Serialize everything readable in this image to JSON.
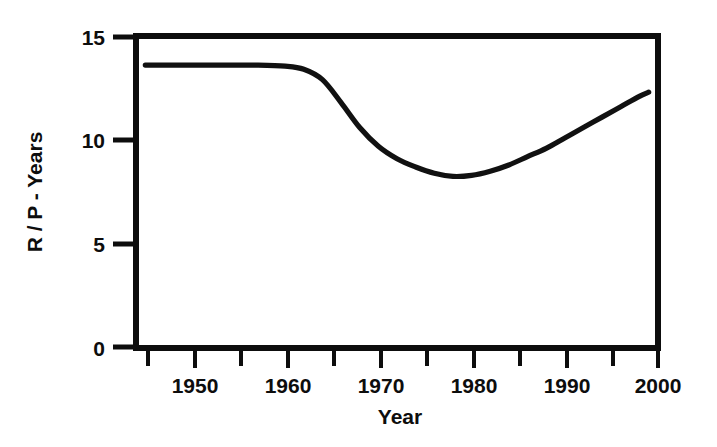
{
  "chart_data": {
    "type": "line",
    "title": "",
    "subtitle": "",
    "xlabel": "Year",
    "ylabel": "R / P - Years",
    "xlim": [
      1944,
      2000
    ],
    "ylim": [
      0,
      15
    ],
    "grid": false,
    "legend": null,
    "x_ticks": [
      1950,
      1960,
      1970,
      1980,
      1990,
      2000
    ],
    "x_tick_labels": [
      "1950",
      "1960",
      "1970",
      "1980",
      "1990",
      "2000"
    ],
    "x_minor_tick_interval": 5,
    "y_ticks": [
      0,
      5,
      10,
      15
    ],
    "y_tick_labels": [
      "0",
      "5",
      "10",
      "15"
    ],
    "line_color": "#111111",
    "line_width_px": 5,
    "series": [
      {
        "name": "R/P ratio",
        "x": [
          1945,
          1948,
          1951,
          1954,
          1957,
          1960,
          1962,
          1964,
          1966,
          1968,
          1970,
          1972,
          1974,
          1976,
          1978,
          1980,
          1982,
          1984,
          1986,
          1988,
          1990,
          1992,
          1994,
          1996,
          1998,
          1999
        ],
        "values": [
          13.6,
          13.6,
          13.6,
          13.6,
          13.6,
          13.55,
          13.4,
          12.9,
          11.8,
          10.6,
          9.7,
          9.1,
          8.7,
          8.4,
          8.25,
          8.3,
          8.5,
          8.8,
          9.2,
          9.6,
          10.1,
          10.6,
          11.1,
          11.6,
          12.1,
          12.3
        ]
      }
    ],
    "annotations": []
  },
  "figure": {
    "xlabel": "Year",
    "ylabel": "R / P - Years",
    "y_tick_labels": [
      "15",
      "10",
      "5",
      "0"
    ],
    "x_tick_labels": [
      "1950",
      "1960",
      "1970",
      "1980",
      "1990",
      "2000"
    ]
  }
}
